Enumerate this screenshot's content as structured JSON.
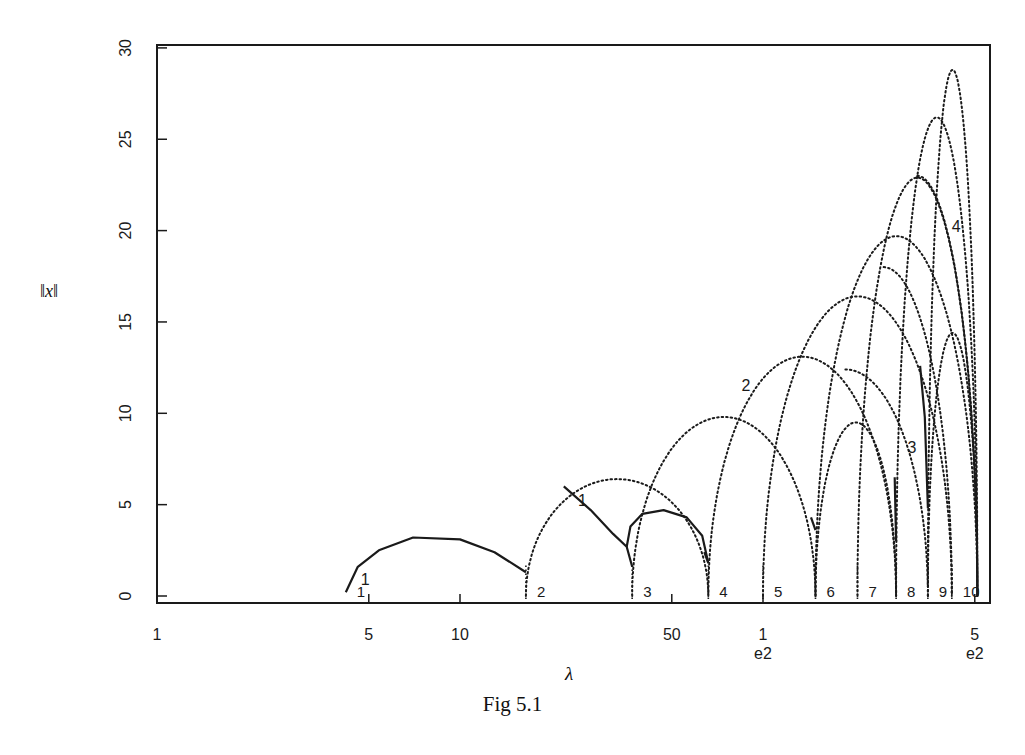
{
  "figure": {
    "caption": "Fig 5.1"
  },
  "chart_data": {
    "type": "line",
    "title": "",
    "caption": "Fig 5.1",
    "xlabel": "λ",
    "ylabel": "‖x‖",
    "xscale": "log",
    "xlim": [
      1,
      520
    ],
    "ylim": [
      0,
      30
    ],
    "grid": false,
    "x_ticks": [
      {
        "value": 1,
        "label": "1",
        "sublabel": ""
      },
      {
        "value": 5,
        "label": "5",
        "sublabel": ""
      },
      {
        "value": 10,
        "label": "10",
        "sublabel": ""
      },
      {
        "value": 50,
        "label": "50",
        "sublabel": ""
      },
      {
        "value": 100,
        "label": "1",
        "sublabel": "e2"
      },
      {
        "value": 500,
        "label": "5",
        "sublabel": "e2"
      }
    ],
    "y_ticks": [
      0,
      5,
      10,
      15,
      20,
      25,
      30
    ],
    "eigenvalue_markers": [
      {
        "label": "1",
        "lambda": 4.2
      },
      {
        "label": "2",
        "lambda": 16.5
      },
      {
        "label": "3",
        "lambda": 37
      },
      {
        "label": "4",
        "lambda": 66
      },
      {
        "label": "5",
        "lambda": 100
      },
      {
        "label": "6",
        "lambda": 149
      },
      {
        "label": "7",
        "lambda": 205
      },
      {
        "label": "8",
        "lambda": 275
      },
      {
        "label": "9",
        "lambda": 350
      },
      {
        "label": "10",
        "lambda": 420
      }
    ],
    "dotted_arcs": [
      {
        "from": 16.5,
        "to": 66,
        "peak": 6.4
      },
      {
        "from": 37,
        "to": 149,
        "peak": 9.8
      },
      {
        "from": 66,
        "to": 275,
        "peak": 13.1
      },
      {
        "from": 100,
        "to": 420,
        "peak": 16.4
      },
      {
        "from": 149,
        "to": 510,
        "peak": 19.7
      },
      {
        "from": 205,
        "to": 510,
        "peak": 22.9,
        "end_value": 21.0
      },
      {
        "from": 275,
        "to": 510,
        "peak": 26.2,
        "end_value": 26.0
      },
      {
        "from": 350,
        "to": 510,
        "peak": 28.8,
        "end_value": 28.8
      },
      {
        "from": 149,
        "to": 275,
        "peak": 9.5
      },
      {
        "from": 350,
        "to": 510,
        "peak": 14.4,
        "end_value": 12.5
      },
      {
        "from": 100,
        "to": 350,
        "peak": 12.4,
        "descending_only": true
      },
      {
        "from": 149,
        "to": 420,
        "peak": 18.0,
        "descending_only": true
      },
      {
        "from": 205,
        "to": 510,
        "peak": 23.0,
        "descending_only": true,
        "end_value": 15.5
      }
    ],
    "solid_segments": [
      {
        "points": [
          [
            4.2,
            0.2
          ],
          [
            4.6,
            1.6
          ],
          [
            5.4,
            2.5
          ],
          [
            7,
            3.2
          ],
          [
            10,
            3.1
          ],
          [
            13,
            2.4
          ],
          [
            16.5,
            1.3
          ]
        ]
      },
      {
        "points": [
          [
            22,
            6.0
          ],
          [
            27,
            4.7
          ],
          [
            32,
            3.4
          ],
          [
            35.5,
            2.7
          ],
          [
            37,
            1.6
          ]
        ]
      },
      {
        "points": [
          [
            35.5,
            2.7
          ],
          [
            36.5,
            3.8
          ],
          [
            40,
            4.5
          ],
          [
            47,
            4.7
          ],
          [
            56,
            4.3
          ],
          [
            63,
            3.3
          ],
          [
            66,
            1.8
          ]
        ]
      },
      {
        "points": [
          [
            66,
            1.8
          ],
          [
            64,
            2.4
          ]
        ]
      },
      {
        "points": [
          [
            149,
            3.6
          ],
          [
            144,
            4.3
          ]
        ]
      },
      {
        "points": [
          [
            275,
            3.0
          ],
          [
            272,
            6.5
          ]
        ]
      },
      {
        "points": [
          [
            350,
            4.8
          ],
          [
            342,
            9.8
          ],
          [
            330,
            12.6
          ]
        ]
      }
    ],
    "branch_labels": [
      {
        "label": "1",
        "lambda": 4.7,
        "value": 0.6
      },
      {
        "label": "1",
        "lambda": 24.5,
        "value": 4.9
      },
      {
        "label": "2",
        "lambda": 85,
        "value": 11.2
      },
      {
        "label": "3",
        "lambda": 300,
        "value": 7.8
      },
      {
        "label": "4",
        "lambda": 420,
        "value": 19.9
      }
    ]
  }
}
